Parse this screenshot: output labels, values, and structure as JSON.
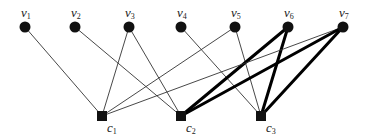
{
  "diagram": {
    "type": "bipartite-graph",
    "variable_nodes": [
      {
        "id": "v1",
        "label": "v",
        "sub": "1"
      },
      {
        "id": "v2",
        "label": "v",
        "sub": "2"
      },
      {
        "id": "v3",
        "label": "v",
        "sub": "3"
      },
      {
        "id": "v4",
        "label": "v",
        "sub": "4"
      },
      {
        "id": "v5",
        "label": "v",
        "sub": "5"
      },
      {
        "id": "v6",
        "label": "v",
        "sub": "6"
      },
      {
        "id": "v7",
        "label": "v",
        "sub": "7"
      }
    ],
    "check_nodes": [
      {
        "id": "c1",
        "label": "c",
        "sub": "1"
      },
      {
        "id": "c2",
        "label": "c",
        "sub": "2"
      },
      {
        "id": "c3",
        "label": "c",
        "sub": "3"
      }
    ],
    "edges": [
      {
        "from": "v1",
        "to": "c1",
        "bold": false
      },
      {
        "from": "v2",
        "to": "c2",
        "bold": false
      },
      {
        "from": "v3",
        "to": "c1",
        "bold": false
      },
      {
        "from": "v3",
        "to": "c2",
        "bold": false
      },
      {
        "from": "v4",
        "to": "c3",
        "bold": false
      },
      {
        "from": "v5",
        "to": "c1",
        "bold": false
      },
      {
        "from": "v5",
        "to": "c3",
        "bold": false
      },
      {
        "from": "v6",
        "to": "c2",
        "bold": true
      },
      {
        "from": "v6",
        "to": "c3",
        "bold": true
      },
      {
        "from": "v7",
        "to": "c1",
        "bold": false
      },
      {
        "from": "v7",
        "to": "c2",
        "bold": true
      },
      {
        "from": "v7",
        "to": "c3",
        "bold": true
      }
    ],
    "colors": {
      "node": "#111111",
      "edge": "#333333",
      "bold_edge": "#000000"
    }
  }
}
